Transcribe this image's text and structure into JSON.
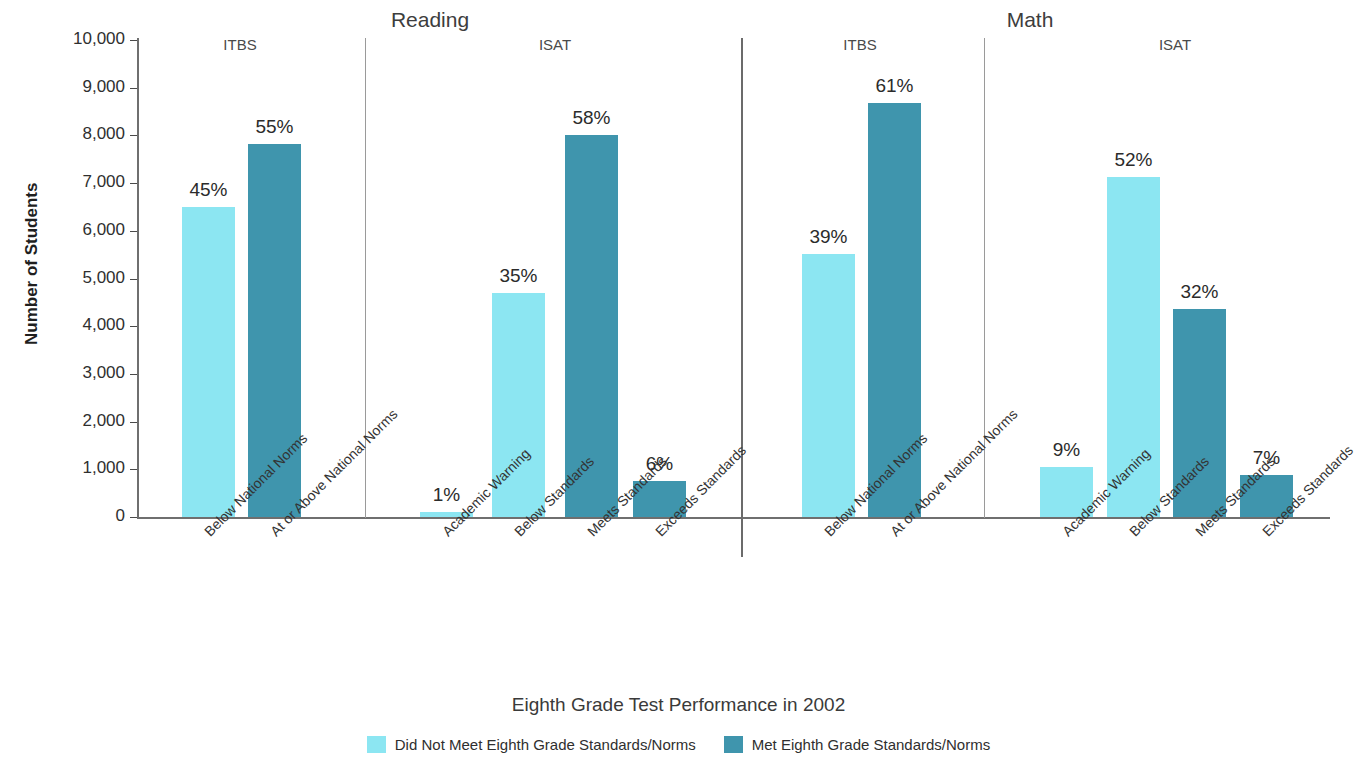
{
  "chart_data": {
    "type": "bar",
    "title": "",
    "xlabel": "Eighth Grade Test Performance in 2002",
    "ylabel": "Number of Students",
    "ylim": [
      0,
      10000
    ],
    "ytick_labels": [
      "10,000",
      "9,000",
      "8,000",
      "7,000",
      "6,000",
      "5,000",
      "4,000",
      "3,000",
      "2,000",
      "1,000",
      "0"
    ],
    "ytick_values": [
      10000,
      9000,
      8000,
      7000,
      6000,
      5000,
      4000,
      3000,
      2000,
      1000,
      0
    ],
    "grid": false,
    "legend_position": "bottom",
    "series": [
      {
        "name": "Did Not Meet Eighth Grade Standards/Norms",
        "color": "#8ce6f2"
      },
      {
        "name": "Met Eighth Grade Standards/Norms",
        "color": "#3f95ad"
      }
    ],
    "groups": [
      {
        "group": "Reading",
        "tests": [
          {
            "test": "ITBS",
            "bars": [
              {
                "category": "Below National Norms",
                "value": 6490,
                "label": "45%",
                "series": "Did Not Meet Eighth Grade Standards/Norms"
              },
              {
                "category": "At or Above National Norms",
                "value": 7820,
                "label": "55%",
                "series": "Met Eighth Grade Standards/Norms"
              }
            ]
          },
          {
            "test": "ISAT",
            "bars": [
              {
                "category": "Academic Warning",
                "value": 105,
                "label": "1%",
                "series": "Did Not Meet Eighth Grade Standards/Norms"
              },
              {
                "category": "Below Standards",
                "value": 4690,
                "label": "35%",
                "series": "Did Not Meet Eighth Grade Standards/Norms"
              },
              {
                "category": "Meets Standards",
                "value": 8010,
                "label": "58%",
                "series": "Met Eighth Grade Standards/Norms"
              },
              {
                "category": "Exceeds Standards",
                "value": 760,
                "label": "6%",
                "series": "Met Eighth Grade Standards/Norms"
              }
            ]
          }
        ]
      },
      {
        "group": "Math",
        "tests": [
          {
            "test": "ITBS",
            "bars": [
              {
                "category": "Below National Norms",
                "value": 5510,
                "label": "39%",
                "series": "Did Not Meet Eighth Grade Standards/Norms"
              },
              {
                "category": "At or Above National Norms",
                "value": 8680,
                "label": "61%",
                "series": "Met Eighth Grade Standards/Norms"
              }
            ]
          },
          {
            "test": "ISAT",
            "bars": [
              {
                "category": "Academic Warning",
                "value": 1040,
                "label": "9%",
                "series": "Did Not Meet Eighth Grade Standards/Norms"
              },
              {
                "category": "Below Standards",
                "value": 7130,
                "label": "52%",
                "series": "Did Not Meet Eighth Grade Standards/Norms"
              },
              {
                "category": "Meets Standards",
                "value": 4360,
                "label": "32%",
                "series": "Met Eighth Grade Standards/Norms"
              },
              {
                "category": "Exceeds Standards",
                "value": 890,
                "label": "7%",
                "series": "Met Eighth Grade Standards/Norms"
              }
            ]
          }
        ]
      }
    ]
  },
  "axis": {
    "y_title": "Number of Students",
    "x_title": "Eighth Grade Test Performance in 2002"
  },
  "group_titles": [
    "Reading",
    "Math"
  ],
  "test_titles": [
    "ITBS",
    "ISAT",
    "ITBS",
    "ISAT"
  ],
  "legend": {
    "items": [
      {
        "label": "Did Not Meet Eighth Grade Standards/Norms",
        "color": "#8ce6f2"
      },
      {
        "label": "Met Eighth Grade Standards/Norms",
        "color": "#3f95ad"
      }
    ]
  },
  "colors": {
    "light": "#8ce6f2",
    "dark": "#3f95ad",
    "axis": "#6f6f6f",
    "divider": "#9a9a9a",
    "text": "#2b2b2b"
  }
}
